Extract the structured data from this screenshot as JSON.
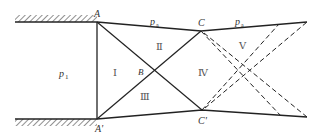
{
  "diagram": {
    "type": "shock-expansion wave reflection diagram",
    "points": {
      "A": {
        "label": "A",
        "x": 97,
        "y": 22
      },
      "A_prime": {
        "label": "A'",
        "x": 97,
        "y": 119
      },
      "B": {
        "label": "B",
        "x": 153,
        "y": 71
      },
      "C": {
        "label": "C",
        "x": 201,
        "y": 31
      },
      "C_prime": {
        "label": "C'",
        "x": 202,
        "y": 110
      }
    },
    "pressure_labels": {
      "p1": {
        "text": "p",
        "sub": "1"
      },
      "pa_left": {
        "text": "p",
        "sub": "a"
      },
      "pa_right": {
        "text": "p",
        "sub": "a"
      }
    },
    "regions": [
      {
        "id": "I",
        "label": "Ⅰ"
      },
      {
        "id": "II",
        "label": "Ⅱ"
      },
      {
        "id": "III",
        "label": "Ⅲ"
      },
      {
        "id": "IV",
        "label": "Ⅳ"
      },
      {
        "id": "V",
        "label": "Ⅴ"
      }
    ]
  }
}
